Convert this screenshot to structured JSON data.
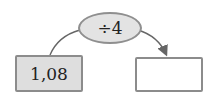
{
  "diagram": {
    "operation": {
      "label": "÷4"
    },
    "input": {
      "value": "1,08"
    },
    "output": {
      "value": ""
    },
    "colors": {
      "stroke": "#8c8c8c",
      "ellipse_fill": "#e3e3e3",
      "input_fill": "#dedede",
      "output_fill": "#ffffff",
      "arrow": "#666666"
    }
  }
}
